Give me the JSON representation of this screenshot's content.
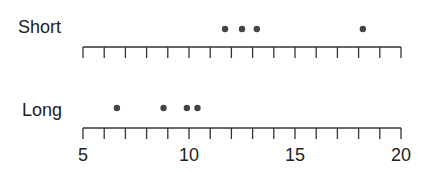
{
  "chart_data": {
    "type": "scatter",
    "subtype": "strip-plot",
    "title": "",
    "xlabel": "",
    "ylabel": "",
    "xlim": [
      5,
      20
    ],
    "x_major_ticks": [
      5,
      10,
      15,
      20
    ],
    "x_minor_tick_step": 1,
    "tick_labels": [
      "5",
      "10",
      "15",
      "20"
    ],
    "grid": false,
    "legend": null,
    "point_color": "#444444",
    "series": [
      {
        "name": "Short",
        "values": [
          11.7,
          12.5,
          13.2,
          18.2
        ]
      },
      {
        "name": "Long",
        "values": [
          6.6,
          8.8,
          9.9,
          10.4
        ]
      }
    ]
  },
  "labels": {
    "short": "Short",
    "long": "Long",
    "tick_5": "5",
    "tick_10": "10",
    "tick_15": "15",
    "tick_20": "20"
  }
}
